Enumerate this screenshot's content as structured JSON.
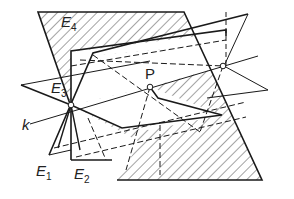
{
  "figure": {
    "type": "geometric-diagram",
    "colors": {
      "stroke": "#1a1a1a",
      "hatch": "#333333",
      "background": "#ffffff"
    },
    "labels": {
      "E4": {
        "base": "E",
        "sub": "4"
      },
      "E3": {
        "base": "E",
        "sub": "3"
      },
      "E1": {
        "base": "E",
        "sub": "1"
      },
      "E2": {
        "base": "E",
        "sub": "2"
      },
      "P": "P",
      "k": "k"
    },
    "points": [
      {
        "name": "intersection-left",
        "x": 71,
        "y": 105
      },
      {
        "name": "P",
        "x": 150,
        "y": 87
      },
      {
        "name": "intersection-right",
        "x": 223,
        "y": 66
      }
    ]
  }
}
